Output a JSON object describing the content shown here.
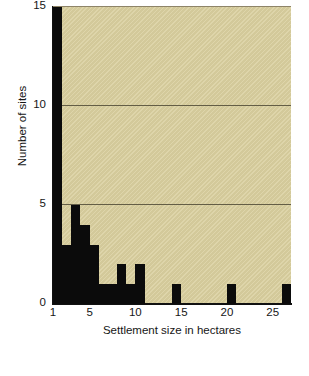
{
  "figure": {
    "background": "#ffffff",
    "plot_background": "#d9cf9e",
    "bar_color": "#0b0b0b",
    "gridline_color": "#4f4a36",
    "axis_color": "#111111"
  },
  "chart_data": {
    "type": "bar",
    "title": "",
    "subtitle": "",
    "xlabel": "Settlement size in hectares",
    "ylabel": "Number of sites",
    "xlim": [
      1,
      27
    ],
    "ylim": [
      0,
      15
    ],
    "xticks": [
      1,
      5,
      10,
      15,
      20,
      25
    ],
    "xtick_labels": [
      "1",
      "5",
      "10",
      "15",
      "20",
      "25"
    ],
    "yticks": [
      0,
      5,
      10,
      15
    ],
    "ytick_labels": [
      "0",
      "5",
      "10",
      "15"
    ],
    "gridlines_y": [
      5,
      10
    ],
    "grid": "horizontal-only",
    "legend": null,
    "bin_width": 1,
    "note": "first bin is clipped at the top of the axis",
    "categories": [
      "1-2",
      "2-3",
      "3-4",
      "4-5",
      "5-6",
      "6-7",
      "7-8",
      "8-9",
      "9-10",
      "10-11",
      "14-15",
      "20-21",
      "26-27"
    ],
    "bins": [
      {
        "start": 1,
        "end": 2,
        "value": 16,
        "clipped": true
      },
      {
        "start": 2,
        "end": 3,
        "value": 3,
        "clipped": false
      },
      {
        "start": 3,
        "end": 4,
        "value": 5,
        "clipped": false
      },
      {
        "start": 4,
        "end": 5,
        "value": 4,
        "clipped": false
      },
      {
        "start": 5,
        "end": 6,
        "value": 3,
        "clipped": false
      },
      {
        "start": 6,
        "end": 7,
        "value": 1,
        "clipped": false
      },
      {
        "start": 7,
        "end": 8,
        "value": 1,
        "clipped": false
      },
      {
        "start": 8,
        "end": 9,
        "value": 2,
        "clipped": false
      },
      {
        "start": 9,
        "end": 10,
        "value": 1,
        "clipped": false
      },
      {
        "start": 10,
        "end": 11,
        "value": 2,
        "clipped": false
      },
      {
        "start": 14,
        "end": 15,
        "value": 1,
        "clipped": false
      },
      {
        "start": 20,
        "end": 21,
        "value": 1,
        "clipped": false
      },
      {
        "start": 26,
        "end": 27,
        "value": 1,
        "clipped": false
      }
    ],
    "values": [
      16,
      3,
      5,
      4,
      3,
      1,
      1,
      2,
      1,
      2,
      1,
      1,
      1
    ]
  }
}
